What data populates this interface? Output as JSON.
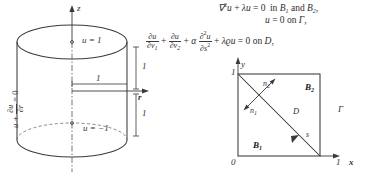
{
  "figure": {
    "ink_color": "#2e2e2e",
    "background": "#ffffff"
  },
  "cylinder": {
    "axis_z_label": "z",
    "axis_r_label": "r",
    "top_face_condition": "u = 1",
    "bottom_face_condition": "u = −1",
    "lateral_condition": "u + ∂u/∂r = 0",
    "lateral_condition_parts": {
      "lead": "u +",
      "numerator": "∂u",
      "denominator": "∂r",
      "tail": "= 0"
    },
    "radius_label": "1",
    "upper_height_label": "1",
    "lower_height_label": "1",
    "origin_marker": "o"
  },
  "equations": {
    "line1": {
      "operator": "∇",
      "operator_sup": "2",
      "u1": "u",
      "plus": "+",
      "lambda": "λ",
      "u2": "u",
      "equals": "= 0",
      "text": "in",
      "region1": "B",
      "region1_sub": "1",
      "and": "and",
      "region2": "B",
      "region2_sub": "2",
      "comma": ","
    },
    "line2": {
      "u": "u",
      "equals": "= 0",
      "on": "on",
      "boundary": "Γ",
      "comma": ","
    },
    "line3": {
      "frac1_num": "∂u",
      "frac1_den": "∂ν",
      "frac1_den_sub": "1",
      "plus1": "+",
      "frac2_num": "∂u",
      "frac2_den": "∂ν",
      "frac2_den_sub": "2",
      "plus2": "+",
      "alpha": "α",
      "frac3_num": "∂",
      "frac3_num_sup": "2",
      "frac3_num_u": "u",
      "frac3_den": "∂s",
      "frac3_den_sup": "2",
      "plus3": "+",
      "lambda": "λ",
      "rho": "ϱ",
      "u": "u",
      "equals": "= 0",
      "on": "on",
      "domain": "D",
      "comma": ","
    }
  },
  "square": {
    "axis_x_label": "x",
    "axis_y_label": "y",
    "origin_label": "0",
    "x_tick_label": "1",
    "y_tick_label": "1",
    "region_lower": "B",
    "region_lower_sub": "1",
    "region_upper": "B",
    "region_upper_sub": "2",
    "diagonal_label": "D",
    "arc_length_label": "s",
    "boundary_label": "Γ",
    "normal_1": "n",
    "normal_1_sub": "1",
    "normal_2": "n",
    "normal_2_sub": "2"
  }
}
